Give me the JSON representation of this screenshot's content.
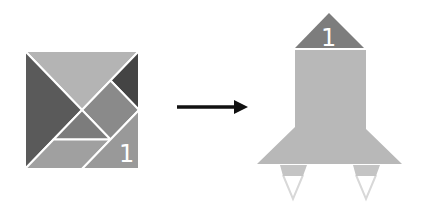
{
  "diagram": {
    "type": "tangram-transformation",
    "source": {
      "name": "tangram-square",
      "pieces": [
        {
          "id": "large-triangle-top",
          "color": "#b4b4b4"
        },
        {
          "id": "large-triangle-left",
          "color": "#5a5a5a"
        },
        {
          "id": "small-triangle-top-right",
          "color": "#444444"
        },
        {
          "id": "square",
          "color": "#8a8a8a"
        },
        {
          "id": "small-triangle-middle",
          "color": "#7c7c7c"
        },
        {
          "id": "parallelogram",
          "color": "#a0a0a0"
        },
        {
          "id": "medium-triangle-bottom-right",
          "color": "#999999",
          "label": "1"
        }
      ]
    },
    "arrow": {
      "direction": "right",
      "color": "#111111"
    },
    "target": {
      "name": "rocket-silhouette",
      "nose_color": "#7d7d7d",
      "nose_label": "1",
      "body_color": "#b8b8b8",
      "thruster_color": "#c4c4c4",
      "flame_color": "#d8d8d8"
    }
  }
}
